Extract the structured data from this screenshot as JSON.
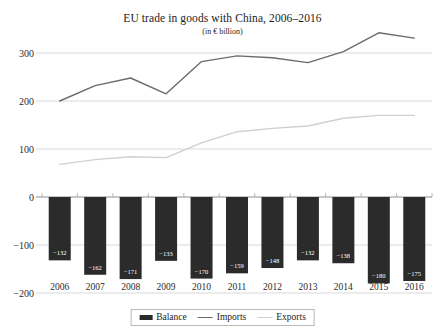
{
  "chart_data": {
    "type": "bar",
    "title": "EU trade in goods with China, 2006–2016",
    "subtitle": "(in € billion)",
    "xlabel": "",
    "ylabel": "",
    "ylim": [
      -200,
      380
    ],
    "yticks": [
      300,
      200,
      100,
      0,
      -100,
      -200
    ],
    "ytick_labels": [
      "300",
      "200",
      "100",
      "0",
      "−100",
      "−200"
    ],
    "grid": true,
    "legend_position": "bottom",
    "categories": [
      "2006",
      "2007",
      "2008",
      "2009",
      "2010",
      "2011",
      "2012",
      "2013",
      "2014",
      "2015",
      "2016"
    ],
    "series": [
      {
        "name": "Balance",
        "type": "bar",
        "color": "#2b2b2b",
        "values": [
          -132,
          -162,
          -171,
          -133,
          -170,
          -159,
          -148,
          -132,
          -138,
          -180,
          -175
        ],
        "labels": [
          "−132",
          "−162",
          "−171",
          "−133",
          "−170",
          "−159",
          "−148",
          "−132",
          "−138",
          "−180",
          "−175"
        ]
      },
      {
        "name": "Imports",
        "type": "line",
        "color": "#6b6b6b",
        "values": [
          200,
          232,
          248,
          215,
          282,
          294,
          290,
          280,
          303,
          342,
          331
        ]
      },
      {
        "name": "Exports",
        "type": "line",
        "color": "#d0d0d0",
        "values": [
          68,
          78,
          84,
          82,
          113,
          136,
          143,
          148,
          164,
          170,
          170
        ]
      }
    ]
  },
  "legend": {
    "items": [
      {
        "label": "Balance"
      },
      {
        "label": "Imports"
      },
      {
        "label": "Exports"
      }
    ]
  }
}
